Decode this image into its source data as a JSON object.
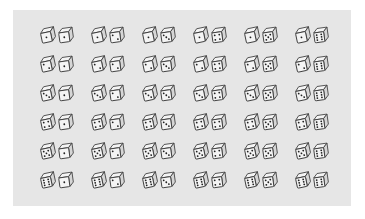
{
  "figure": {
    "rows_label": "left die value (1-6, top to bottom)",
    "cols_label": "right die value (1-6, left to right)",
    "colors": {
      "panel": "#e6e6e6",
      "stroke": "#3a3a3a",
      "face": "#f4f4f4",
      "side": "#d6d6d6",
      "pip": "#222222"
    },
    "outcomes": [
      [
        [
          1,
          1
        ],
        [
          1,
          2
        ],
        [
          1,
          3
        ],
        [
          1,
          4
        ],
        [
          1,
          5
        ],
        [
          1,
          6
        ]
      ],
      [
        [
          2,
          1
        ],
        [
          2,
          2
        ],
        [
          2,
          3
        ],
        [
          2,
          4
        ],
        [
          2,
          5
        ],
        [
          2,
          6
        ]
      ],
      [
        [
          3,
          1
        ],
        [
          3,
          2
        ],
        [
          3,
          3
        ],
        [
          3,
          4
        ],
        [
          3,
          5
        ],
        [
          3,
          6
        ]
      ],
      [
        [
          4,
          1
        ],
        [
          4,
          2
        ],
        [
          4,
          3
        ],
        [
          4,
          4
        ],
        [
          4,
          5
        ],
        [
          4,
          6
        ]
      ],
      [
        [
          5,
          1
        ],
        [
          5,
          2
        ],
        [
          5,
          3
        ],
        [
          5,
          4
        ],
        [
          5,
          5
        ],
        [
          5,
          6
        ]
      ],
      [
        [
          6,
          1
        ],
        [
          6,
          2
        ],
        [
          6,
          3
        ],
        [
          6,
          4
        ],
        [
          6,
          5
        ],
        [
          6,
          6
        ]
      ]
    ]
  }
}
